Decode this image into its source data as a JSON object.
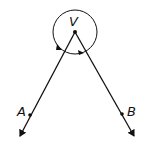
{
  "diagram": {
    "type": "angle",
    "vertex": {
      "label": "V",
      "x": 75,
      "y": 32
    },
    "points": [
      {
        "label": "A",
        "x": 30,
        "y": 115
      },
      {
        "label": "B",
        "x": 121,
        "y": 114
      }
    ],
    "rays": [
      "VA",
      "VB"
    ],
    "reflex_angle_arc": {
      "center": "V",
      "radius": 22,
      "direction": "around outside"
    },
    "colors": {
      "stroke": "#111111",
      "background": "#ffffff"
    }
  }
}
